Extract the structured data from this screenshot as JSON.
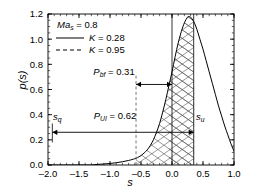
{
  "chart_data": {
    "type": "line",
    "title": "",
    "xlabel": "s",
    "ylabel": "p(s)",
    "xlim": [
      -2.0,
      1.0
    ],
    "ylim": [
      0.0,
      1.2
    ],
    "grid": false,
    "xticks": [
      "-2.0",
      "-1.5",
      "-1.0",
      "-0.5",
      "0.0",
      "0.5",
      "1.0"
    ],
    "xtick_values": [
      -2.0,
      -1.5,
      -1.0,
      -0.5,
      0.0,
      0.5,
      1.0
    ],
    "yticks": [
      "0.0",
      "0.2",
      "0.4",
      "0.6",
      "0.8",
      "1.0",
      "1.2"
    ],
    "ytick_values": [
      0.0,
      0.2,
      0.4,
      0.6,
      0.8,
      1.0,
      1.2
    ],
    "legend_position": "upper-left",
    "series": [
      {
        "name": "p(s)",
        "style": "solid",
        "x": [
          -2.0,
          -1.8,
          -1.6,
          -1.5,
          -1.4,
          -1.3,
          -1.2,
          -1.1,
          -1.0,
          -0.9,
          -0.8,
          -0.7,
          -0.6,
          -0.55,
          -0.5,
          -0.45,
          -0.4,
          -0.35,
          -0.3,
          -0.25,
          -0.2,
          -0.15,
          -0.1,
          -0.05,
          0.0,
          0.05,
          0.1,
          0.15,
          0.2,
          0.25,
          0.27,
          0.3,
          0.35,
          0.4,
          0.45,
          0.5,
          0.55,
          0.6,
          0.65,
          0.7,
          0.75,
          0.8,
          0.85,
          0.9,
          0.95,
          1.0
        ],
        "y": [
          0.0,
          0.0,
          0.0,
          0.0,
          0.0,
          0.0,
          0.005,
          0.008,
          0.012,
          0.018,
          0.026,
          0.036,
          0.05,
          0.06,
          0.075,
          0.095,
          0.12,
          0.155,
          0.2,
          0.26,
          0.33,
          0.42,
          0.52,
          0.63,
          0.74,
          0.86,
          0.97,
          1.06,
          1.13,
          1.175,
          1.18,
          1.175,
          1.14,
          1.08,
          1.0,
          0.92,
          0.83,
          0.74,
          0.65,
          0.56,
          0.47,
          0.39,
          0.31,
          0.24,
          0.17,
          0.11
        ]
      }
    ],
    "annotations": {
      "mach_label": "Ma",
      "mach_sub": "s",
      "mach_value": " = 0.8",
      "legend_solid_sym": "K",
      "legend_solid_value": " = 0.28",
      "legend_dash_sym": "K",
      "legend_dash_value": " = 0.95",
      "pbf_sym": "P",
      "pbf_sub": "bf",
      "pbf_value": " = 0.31",
      "pui_sym": "P",
      "pui_sub": "UI",
      "pui_value": " = 0.62",
      "sq_sym": "s",
      "sq_sub": "q",
      "su_sym": "s",
      "su_sub": "u"
    },
    "markers": {
      "s_q": -1.93,
      "s_bf_dashed": -0.58,
      "s_zero": 0.0,
      "s_u": 0.35,
      "pui_arrow_y": 0.26,
      "pbf_arrow_y": 0.64,
      "hatch_region_cross": [
        -0.58,
        0.35
      ],
      "hatch_region_single": [
        -0.05,
        0.35
      ]
    },
    "colors": {
      "curve": "#000000",
      "axis": "#000000",
      "hatch": "#555555"
    }
  }
}
